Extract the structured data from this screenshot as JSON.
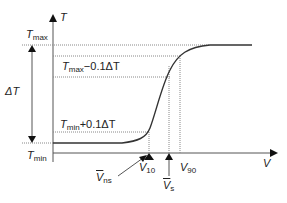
{
  "diagram": {
    "axes": {
      "y_label": "T",
      "x_label": "V"
    },
    "levels": {
      "t_max": {
        "sym": "T",
        "sub": "max"
      },
      "t_min": {
        "sym": "T",
        "sub": "min"
      },
      "upper": {
        "sym": "T",
        "sub": "max",
        "rest": "−0.1ΔT"
      },
      "lower": {
        "sym": "T",
        "sub": "min",
        "rest": "+0.1ΔT"
      },
      "delta": "ΔT"
    },
    "markers": {
      "v_ns": {
        "sym": "V",
        "sub": "ns"
      },
      "v_10": {
        "sym": "V",
        "sub": "10"
      },
      "v_s": {
        "sym": "V",
        "sub": "s"
      },
      "v_90": {
        "sym": "V",
        "sub": "90"
      }
    },
    "colors": {
      "line": "#333333",
      "dotted": "#888888"
    }
  }
}
